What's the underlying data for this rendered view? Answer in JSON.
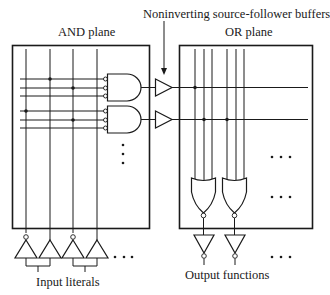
{
  "labels": {
    "and_plane": "AND plane",
    "or_plane": "OR plane",
    "buffers": "Noninverting source-follower buffers",
    "input_literals": "Input literals",
    "output_functions": "Output functions"
  },
  "and_plane": {
    "input_columns": 4,
    "product_term_groups": 2,
    "lines_per_gate": 3,
    "connections": [
      {
        "row": 0,
        "col": 1
      },
      {
        "row": 1,
        "col": 2
      },
      {
        "row": 3,
        "col": 0
      },
      {
        "row": 4,
        "col": 2
      }
    ]
  },
  "or_plane": {
    "columns": 6,
    "rows": 2,
    "connections": [
      {
        "row": 0,
        "col": 0
      },
      {
        "row": 1,
        "col": 1
      },
      {
        "row": 1,
        "col": 3
      }
    ]
  },
  "inputs": {
    "buffers": [
      {
        "inverted": true
      },
      {
        "inverted": false
      },
      {
        "inverted": true
      },
      {
        "inverted": false
      }
    ],
    "ellipsis": "..."
  },
  "outputs": {
    "inverters": 2,
    "ellipsis": "..."
  },
  "colors": {
    "stroke": "#1a1a1a",
    "background": "#ffffff"
  }
}
